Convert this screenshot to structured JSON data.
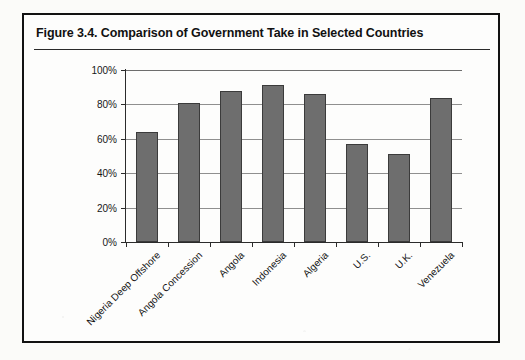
{
  "figure": {
    "title": "Figure 3.4.  Comparison of Government Take in Selected Countries"
  },
  "chart_data": {
    "type": "bar",
    "title": "Comparison of Government Take in Selected Countries",
    "xlabel": "",
    "ylabel": "",
    "ylim": [
      0,
      100
    ],
    "ytick_labels": [
      "100%",
      "80%",
      "60%",
      "40%",
      "20%",
      "0%"
    ],
    "ytick_values": [
      100,
      80,
      60,
      40,
      20,
      0
    ],
    "grid": true,
    "legend": false,
    "unit": "percent",
    "categories": [
      "Nigeria Deep Offshore",
      "Angola Concession",
      "Angola",
      "Indonesia",
      "Algeria",
      "U.S.",
      "U.K.",
      "Venezuela"
    ],
    "values": [
      64,
      81,
      88,
      91,
      86,
      57,
      51,
      84
    ],
    "bar_color": "#6e6e6e",
    "bar_edge_color": "#3b3b3b"
  }
}
